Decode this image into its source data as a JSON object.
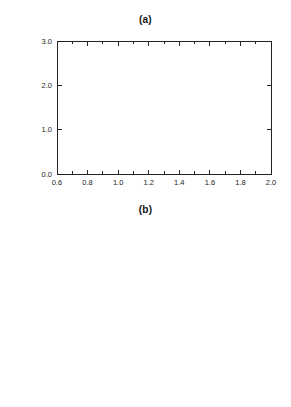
{
  "figure": {
    "background": "#ffffff",
    "line_color": "#3a3a3a",
    "axis_color": "#222222"
  },
  "panels": [
    {
      "id": "a",
      "title": "(a)",
      "ylabel_prefix": "Target, ",
      "ylabel_var": "X",
      "ylabel_suffix": "(T)",
      "xlabel": "",
      "xticks": [
        "0.6",
        "0.8",
        "1.0",
        "1.2",
        "1.4",
        "1.6",
        "1.8",
        "2.0"
      ],
      "xtick_values": [
        0.6,
        0.8,
        1.0,
        1.2,
        1.4,
        1.6,
        1.8,
        2.0
      ],
      "yticks": [
        "0.0",
        "1.0",
        "2.0",
        "3.0"
      ],
      "ytick_values": [
        0.0,
        1.0,
        2.0,
        3.0
      ],
      "xlim": [
        0.6,
        2.0
      ],
      "ylim": [
        0.0,
        3.0
      ],
      "annotations": [
        {
          "name": "label-cb-1p2",
          "prefix": "c",
          "sub": "b",
          "suffix": " = 1.2 g",
          "x": 1.38,
          "y": 1.98
        },
        {
          "name": "label-cb-0p6",
          "prefix": "c",
          "sub": "b",
          "suffix": " = 0.6 g",
          "x": 1.13,
          "y": 0.98
        }
      ]
    },
    {
      "id": "b",
      "title": "(b)",
      "ylabel_prefix": "Fitness, ",
      "ylabel_var": "F",
      "ylabel_suffix": "(x",
      "ylabel_sub": "0",
      "ylabel_tail": ",0,0)",
      "xlabel_prefix": "Food availability, ",
      "xlabel_var": "e",
      "xlabel_sub": "2",
      "xticks": [
        "0.6",
        "0.8",
        "1.0",
        "1.2",
        "1.4",
        "1.6",
        "1.8",
        "2.0"
      ],
      "xtick_values": [
        0.6,
        0.8,
        1.0,
        1.2,
        1.4,
        1.6,
        1.8,
        2.0
      ],
      "yticks": [
        "0.0",
        "0.2",
        "0.4",
        "0.6",
        "0.8",
        "1.0"
      ],
      "ytick_values": [
        0.0,
        0.2,
        0.4,
        0.6,
        0.8,
        1.0
      ],
      "xlim": [
        0.6,
        2.0
      ],
      "ylim": [
        0.0,
        1.0
      ],
      "annotations": [
        {
          "name": "label-cb-0p6",
          "prefix": "c",
          "sub": "b",
          "suffix": " = 0.6 g",
          "x": 1.03,
          "y": 0.845
        },
        {
          "name": "label-cb-1p2",
          "prefix": "c",
          "sub": "b",
          "suffix": " = 1.2 g",
          "x": 1.46,
          "y": 0.478
        }
      ]
    }
  ],
  "chart_data": [
    {
      "type": "line",
      "panel": "a",
      "title": "(a)",
      "xlabel": "Food availability, e2",
      "ylabel": "Target, X(T)",
      "xlim": [
        0.6,
        2.0
      ],
      "ylim": [
        0.0,
        3.0
      ],
      "xticks": [
        0.6,
        0.8,
        1.0,
        1.2,
        1.4,
        1.6,
        1.8,
        2.0
      ],
      "yticks": [
        0.0,
        1.0,
        2.0,
        3.0
      ],
      "grid": false,
      "legend": "inline-annotation",
      "series": [
        {
          "name": "cb = 1.2 g",
          "x": [
            0.7,
            0.8,
            0.9,
            1.0,
            1.1,
            1.2,
            1.3,
            1.4,
            1.5,
            1.6,
            1.7,
            1.8,
            1.9,
            2.0
          ],
          "y": [
            2.4,
            2.4,
            2.4,
            2.4,
            2.39,
            2.37,
            2.32,
            2.05,
            1.78,
            1.37,
            1.31,
            1.28,
            1.26,
            1.25
          ]
        },
        {
          "name": "cb = 0.6 g",
          "x": [
            0.7,
            0.8,
            0.9,
            1.0,
            1.1,
            1.2,
            1.3,
            1.4,
            1.5,
            1.6,
            1.7,
            1.8,
            1.9,
            2.0
          ],
          "y": [
            2.15,
            1.85,
            1.55,
            0.78,
            0.75,
            0.73,
            0.72,
            0.71,
            0.7,
            0.69,
            0.68,
            0.68,
            0.67,
            0.66
          ]
        }
      ]
    },
    {
      "type": "line",
      "panel": "b",
      "title": "(b)",
      "xlabel": "Food availability, e2",
      "ylabel": "Fitness, F(x0,0,0)",
      "xlim": [
        0.6,
        2.0
      ],
      "ylim": [
        0.0,
        1.0
      ],
      "xticks": [
        0.6,
        0.8,
        1.0,
        1.2,
        1.4,
        1.6,
        1.8,
        2.0
      ],
      "yticks": [
        0.0,
        0.2,
        0.4,
        0.6,
        0.8,
        1.0
      ],
      "grid": false,
      "legend": "inline-annotation",
      "series": [
        {
          "name": "cb = 0.6 g",
          "x": [
            0.7,
            0.75,
            0.8,
            0.85,
            0.9,
            1.0,
            1.1,
            1.2,
            1.3,
            1.4,
            1.5,
            1.6,
            1.7,
            1.8,
            1.9,
            2.0
          ],
          "y": [
            0.07,
            0.17,
            0.28,
            0.38,
            0.47,
            0.585,
            0.665,
            0.715,
            0.755,
            0.775,
            0.79,
            0.8,
            0.805,
            0.808,
            0.81,
            0.812
          ]
        },
        {
          "name": "cb = 1.2 g",
          "x": [
            0.8,
            0.85,
            0.9,
            1.0,
            1.1,
            1.2,
            1.3,
            1.4,
            1.5,
            1.6,
            1.7,
            1.8,
            1.9,
            2.0
          ],
          "y": [
            0.0,
            0.02,
            0.055,
            0.145,
            0.235,
            0.325,
            0.41,
            0.48,
            0.545,
            0.595,
            0.635,
            0.665,
            0.685,
            0.7
          ]
        }
      ]
    }
  ]
}
